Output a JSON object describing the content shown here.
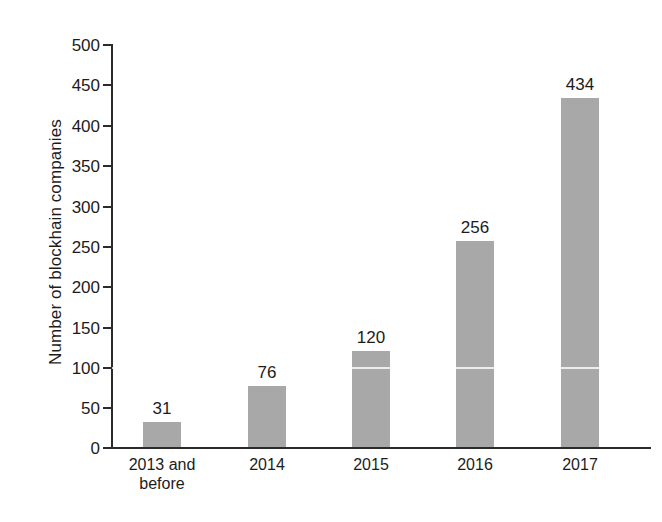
{
  "chart_data": {
    "type": "bar",
    "title": "",
    "subtitle": "",
    "xlabel": "",
    "ylabel": "Number of blockhain companies",
    "categories": [
      "2013 and before",
      "2014",
      "2015",
      "2016",
      "2017"
    ],
    "category_lines": [
      [
        "2013 and",
        "before"
      ],
      [
        "2014"
      ],
      [
        "2015"
      ],
      [
        "2016"
      ],
      [
        "2017"
      ]
    ],
    "values": [
      31,
      76,
      120,
      256,
      434
    ],
    "value_labels": [
      "31",
      "76",
      "120",
      "256",
      "434"
    ],
    "ylim": [
      0,
      500
    ],
    "y_ticks": [
      0,
      50,
      100,
      150,
      200,
      250,
      300,
      350,
      400,
      450,
      500
    ],
    "y_tick_labels": [
      "0",
      "50",
      "100",
      "150",
      "200",
      "250",
      "300",
      "350",
      "400",
      "450",
      "500"
    ],
    "grid": false,
    "legend": "none",
    "bar_color": "#a8a8a8",
    "axis_color": "#2b2b2b",
    "text_color": "#1c1c1c",
    "background_color": "#ffffff"
  }
}
